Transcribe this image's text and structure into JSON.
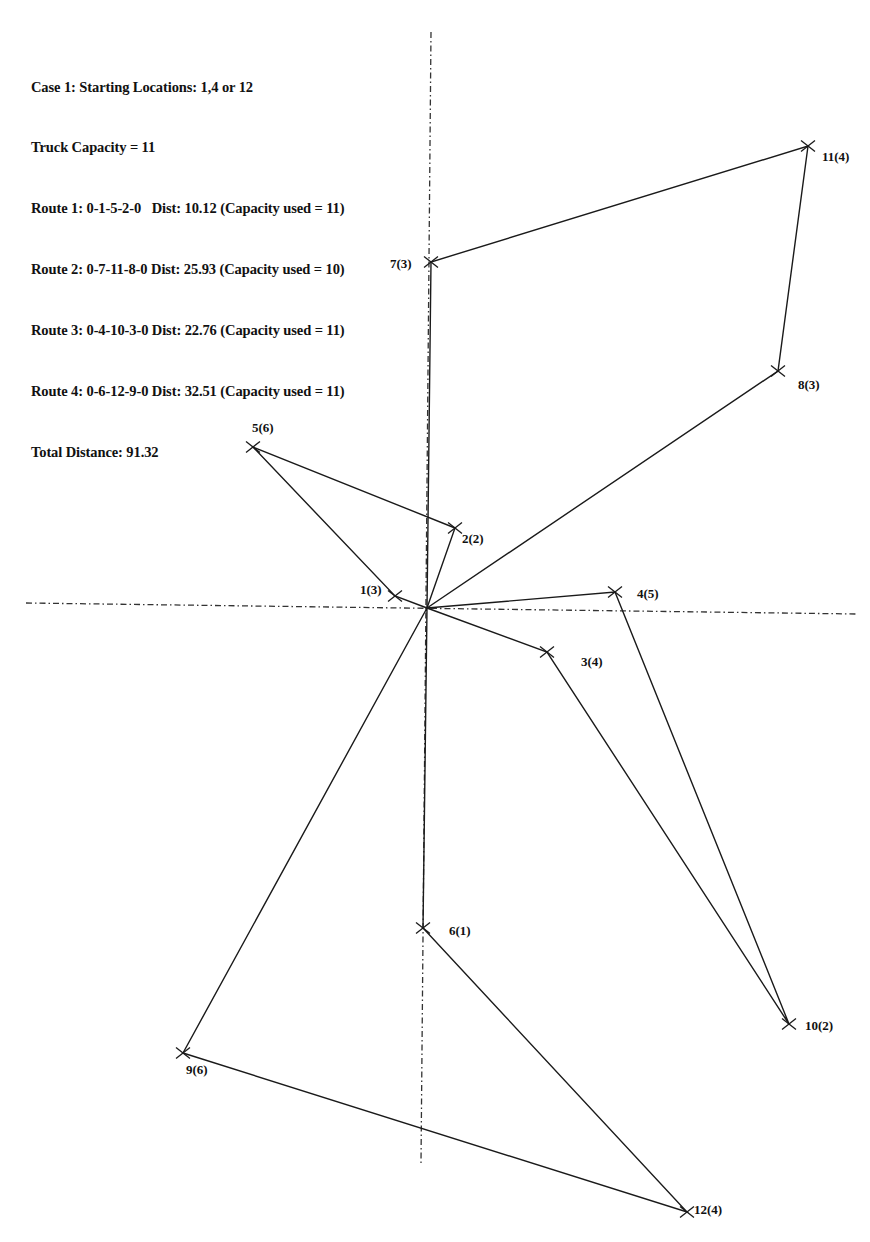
{
  "info": {
    "lines": [
      "Case 1: Starting Locations: 1,4 or 12",
      "Truck Capacity = 11",
      "Route 1: 0-1-5-2-0   Dist: 10.12 (Capacity used = 11)",
      "Route 2: 0-7-11-8-0 Dist: 25.93 (Capacity used = 10)",
      "Route 3: 0-4-10-3-0 Dist: 22.76 (Capacity used = 11)",
      "Route 4: 0-6-12-9-0 Dist: 32.51 (Capacity used = 11)",
      "Total Distance: 91.32"
    ]
  },
  "problem": {
    "case": "Case 1",
    "starting_locations": "1,4 or 12",
    "truck_capacity": 11,
    "total_distance": 91.32
  },
  "depot": {
    "id": 0,
    "x": 427,
    "y": 608
  },
  "axes": {
    "horizontal": {
      "x1": 26,
      "y1": 603,
      "x2": 857,
      "y2": 614
    },
    "vertical": {
      "x1": 431,
      "y1": 32,
      "x2": 421,
      "y2": 1163
    }
  },
  "nodes": [
    {
      "id": 1,
      "demand": 3,
      "label": "1(3)",
      "x": 395,
      "y": 596,
      "lx": 360,
      "ly": 594
    },
    {
      "id": 2,
      "demand": 2,
      "label": "2(2)",
      "x": 455,
      "y": 528,
      "lx": 462,
      "ly": 543
    },
    {
      "id": 3,
      "demand": 4,
      "label": "3(4)",
      "x": 547,
      "y": 652,
      "lx": 581,
      "ly": 666
    },
    {
      "id": 4,
      "demand": 5,
      "label": "4(5)",
      "x": 615,
      "y": 592,
      "lx": 637,
      "ly": 598
    },
    {
      "id": 5,
      "demand": 6,
      "label": "5(6)",
      "x": 253,
      "y": 447,
      "lx": 252,
      "ly": 432
    },
    {
      "id": 6,
      "demand": 1,
      "label": "6(1)",
      "x": 423,
      "y": 928,
      "lx": 449,
      "ly": 935
    },
    {
      "id": 7,
      "demand": 3,
      "label": "7(3)",
      "x": 431,
      "y": 262,
      "lx": 390,
      "ly": 268
    },
    {
      "id": 8,
      "demand": 3,
      "label": "8(3)",
      "x": 778,
      "y": 371,
      "lx": 798,
      "ly": 389
    },
    {
      "id": 9,
      "demand": 6,
      "label": "9(6)",
      "x": 183,
      "y": 1053,
      "lx": 186,
      "ly": 1074
    },
    {
      "id": 10,
      "demand": 2,
      "label": "10(2)",
      "x": 789,
      "y": 1024,
      "lx": 805,
      "ly": 1030
    },
    {
      "id": 11,
      "demand": 4,
      "label": "11(4)",
      "x": 808,
      "y": 146,
      "lx": 822,
      "ly": 161
    },
    {
      "id": 12,
      "demand": 4,
      "label": "12(4)",
      "x": 687,
      "y": 1212,
      "lx": 694,
      "ly": 1214
    }
  ],
  "routes": [
    {
      "name": "Route 1",
      "sequence": [
        0,
        1,
        5,
        2,
        0
      ],
      "distance": 10.12,
      "capacity_used": 11
    },
    {
      "name": "Route 2",
      "sequence": [
        0,
        7,
        11,
        8,
        0
      ],
      "distance": 25.93,
      "capacity_used": 10
    },
    {
      "name": "Route 3",
      "sequence": [
        0,
        4,
        10,
        3,
        0
      ],
      "distance": 22.76,
      "capacity_used": 11
    },
    {
      "name": "Route 4",
      "sequence": [
        0,
        6,
        12,
        9,
        0
      ],
      "distance": 32.51,
      "capacity_used": 11
    }
  ],
  "colors": {
    "ink": "#1a1a1a",
    "background": "#ffffff"
  }
}
